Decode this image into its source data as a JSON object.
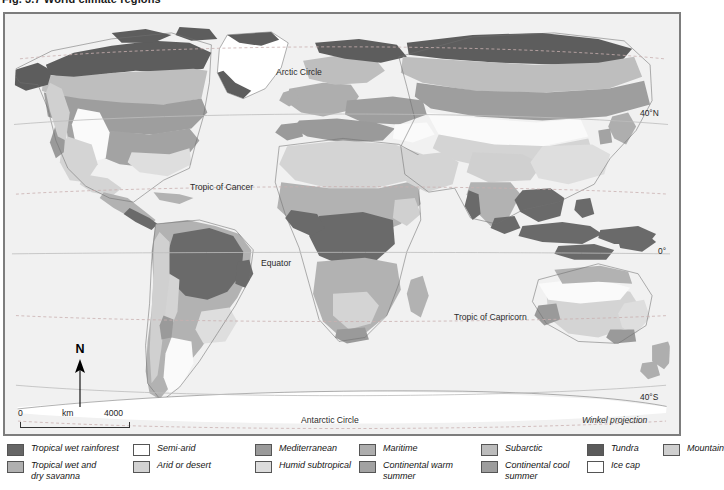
{
  "figure": {
    "title": "Fig. 3.7 World climate regions"
  },
  "map": {
    "projection_note": "Winkel projection",
    "graticule_labels": [
      {
        "name": "arctic-circle",
        "text": "Arctic Circle"
      },
      {
        "name": "tropic-of-cancer",
        "text": "Tropic of Cancer"
      },
      {
        "name": "equator",
        "text": "Equator"
      },
      {
        "name": "tropic-of-capricorn",
        "text": "Tropic of Capricorn"
      },
      {
        "name": "antarctic-circle",
        "text": "Antarctic Circle"
      }
    ],
    "edge_labels": [
      {
        "name": "lat-40n",
        "text": "40°N"
      },
      {
        "name": "lat-0",
        "text": "0°"
      },
      {
        "name": "lat-40s",
        "text": "40°S"
      }
    ],
    "compass": {
      "label": "N"
    },
    "scale": {
      "min": "0",
      "unit": "km",
      "max": "4000"
    }
  },
  "legend": {
    "columns": [
      {
        "items": [
          {
            "label": "Tropical wet rainforest",
            "color": "#666666"
          },
          {
            "label": "Tropical wet and\ndry savanna",
            "color": "#b0b0b0"
          }
        ]
      },
      {
        "items": [
          {
            "label": "Semi-arid",
            "color": "#ffffff"
          },
          {
            "label": "Arid or desert",
            "color": "#d2d2d2"
          }
        ]
      },
      {
        "items": [
          {
            "label": "Mediterranean",
            "color": "#9a9a9a"
          },
          {
            "label": "Humid subtropical",
            "color": "#dcdcdc"
          }
        ]
      },
      {
        "items": [
          {
            "label": "Maritime",
            "color": "#adadad"
          },
          {
            "label": "Continental warm\nsummer",
            "color": "#a2a2a2"
          }
        ]
      },
      {
        "items": [
          {
            "label": "Subarctic",
            "color": "#bcbcbc"
          },
          {
            "label": "Continental cool\nsummer",
            "color": "#9d9d9d"
          }
        ]
      },
      {
        "items": [
          {
            "label": "Tundra",
            "color": "#5b5b5b"
          },
          {
            "label": "Ice cap",
            "color": "#ffffff"
          }
        ]
      },
      {
        "items": [
          {
            "label": "Mountain",
            "color": "#cfcfcf"
          }
        ]
      }
    ]
  },
  "palette": {
    "ocean": "#f1f1f1",
    "frame": "#7d7d7d",
    "graticule_solid": "#b9b9b9",
    "graticule_dashed": "#c4aaaa",
    "coastline": "#6f6f6f"
  }
}
